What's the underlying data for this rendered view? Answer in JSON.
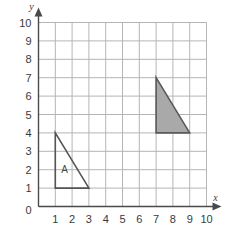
{
  "chart_data": {
    "type": "scatter",
    "title": "",
    "xlabel": "x",
    "ylabel": "y",
    "xlim": [
      0,
      10
    ],
    "ylim": [
      0,
      10
    ],
    "grid": true,
    "grid_step": 1,
    "legend": "none",
    "x_ticks": [
      "0",
      "1",
      "2",
      "3",
      "4",
      "5",
      "6",
      "7",
      "8",
      "9",
      "10"
    ],
    "y_ticks": [
      "0",
      "1",
      "2",
      "3",
      "4",
      "5",
      "6",
      "7",
      "8",
      "9",
      "10"
    ],
    "x_tick_values": [
      0,
      1,
      2,
      3,
      4,
      5,
      6,
      7,
      8,
      9,
      10
    ],
    "y_tick_values": [
      0,
      1,
      2,
      3,
      4,
      5,
      6,
      7,
      8,
      9,
      10
    ],
    "origin_label": "0",
    "shapes": [
      {
        "name": "triangle-a",
        "label": "A",
        "label_x": 1.55,
        "label_y": 1.95,
        "vertices": [
          [
            1,
            4
          ],
          [
            1,
            1
          ],
          [
            3,
            1
          ]
        ],
        "fill": "none",
        "stroke": "#555555",
        "stroke_width": 1.6
      },
      {
        "name": "triangle-shaded",
        "label": "",
        "label_x": 0,
        "label_y": 0,
        "vertices": [
          [
            7,
            7
          ],
          [
            7,
            4
          ],
          [
            9,
            4
          ]
        ],
        "fill": "#a9a9a9",
        "stroke": "#5a5a5a",
        "stroke_width": 1.6
      }
    ],
    "colors": {
      "grid": "#b5b5b5",
      "axis": "#4a4a4a",
      "text": "#3a3a3a",
      "shaded_fill": "#a9a9a9",
      "shape_stroke": "#555555",
      "background": "#ffffff"
    }
  }
}
